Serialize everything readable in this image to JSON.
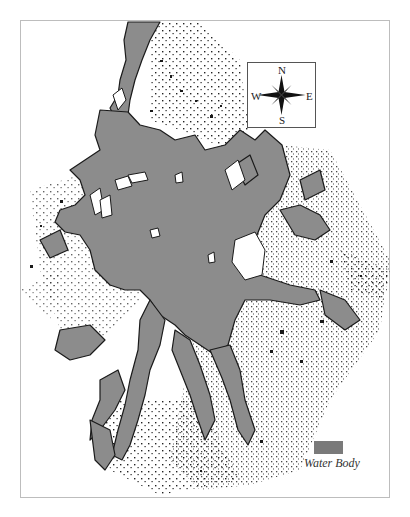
{
  "map": {
    "water_color": "#8c8c8c",
    "land_color": "#ffffff",
    "coast_color": "#1a1a1a",
    "frame_color": "#bdbdbd"
  },
  "compass": {
    "north": "N",
    "south": "S",
    "east": "E",
    "west": "W",
    "icon": "compass-rose-icon"
  },
  "legend": {
    "items": [
      {
        "label": "Water Body",
        "color": "#7a7a7a"
      }
    ]
  }
}
